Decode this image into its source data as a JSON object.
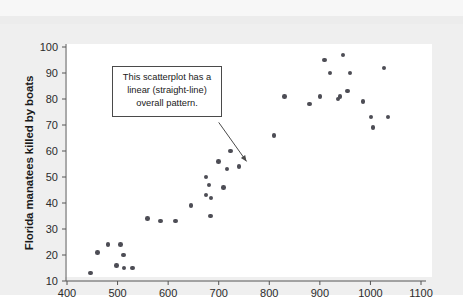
{
  "figure": {
    "background_color": "#efefef",
    "plot_background_color": "#ffffff",
    "point_color": "#4d4d55",
    "axis_color": "#555555"
  },
  "annotation": {
    "text": "This scatterplot has a linear (straight-line) overall pattern.",
    "line1": "This scatterplot has a",
    "line2": "linear (straight-line)",
    "line3": "overall pattern."
  },
  "chart_data": {
    "type": "scatter",
    "title": "",
    "xlabel": "",
    "ylabel": "Florida manatees killed by boats",
    "xlim": [
      380,
      1110
    ],
    "ylim": [
      5,
      103
    ],
    "xticks": [
      400,
      500,
      600,
      700,
      800,
      900,
      1000,
      1100
    ],
    "yticks": [
      10,
      20,
      30,
      40,
      50,
      60,
      70,
      80,
      90,
      100
    ],
    "xtick_labels": [
      "400",
      "500",
      "600",
      "700",
      "800",
      "900",
      "1000",
      "1100"
    ],
    "ytick_labels": [
      "10",
      "20",
      "30",
      "40",
      "50",
      "60",
      "70",
      "80",
      "90",
      "100"
    ],
    "grid": false,
    "legend": false,
    "annotations": [
      {
        "text": "This scatterplot has a linear (straight-line) overall pattern.",
        "arrow_from_x": 700,
        "arrow_from_y": 71,
        "arrow_to_x": 755,
        "arrow_to_y": 56
      }
    ],
    "points": [
      {
        "x": 447,
        "y": 13
      },
      {
        "x": 460,
        "y": 21
      },
      {
        "x": 481,
        "y": 24
      },
      {
        "x": 498,
        "y": 16
      },
      {
        "x": 506,
        "y": 24
      },
      {
        "x": 512,
        "y": 20
      },
      {
        "x": 513,
        "y": 15
      },
      {
        "x": 530,
        "y": 15
      },
      {
        "x": 559,
        "y": 34
      },
      {
        "x": 585,
        "y": 33
      },
      {
        "x": 614,
        "y": 33
      },
      {
        "x": 645,
        "y": 39
      },
      {
        "x": 675,
        "y": 43
      },
      {
        "x": 675,
        "y": 50
      },
      {
        "x": 681,
        "y": 47
      },
      {
        "x": 684,
        "y": 35
      },
      {
        "x": 685,
        "y": 42
      },
      {
        "x": 700,
        "y": 56
      },
      {
        "x": 710,
        "y": 46
      },
      {
        "x": 716,
        "y": 53
      },
      {
        "x": 723,
        "y": 60
      },
      {
        "x": 740,
        "y": 54
      },
      {
        "x": 809,
        "y": 66
      },
      {
        "x": 830,
        "y": 81
      },
      {
        "x": 880,
        "y": 78
      },
      {
        "x": 900,
        "y": 81
      },
      {
        "x": 909,
        "y": 95
      },
      {
        "x": 920,
        "y": 90
      },
      {
        "x": 936,
        "y": 80
      },
      {
        "x": 940,
        "y": 81
      },
      {
        "x": 946,
        "y": 97
      },
      {
        "x": 955,
        "y": 83
      },
      {
        "x": 960,
        "y": 90
      },
      {
        "x": 985,
        "y": 79
      },
      {
        "x": 1001,
        "y": 73
      },
      {
        "x": 1005,
        "y": 69
      },
      {
        "x": 1027,
        "y": 92
      },
      {
        "x": 1035,
        "y": 73
      }
    ]
  }
}
